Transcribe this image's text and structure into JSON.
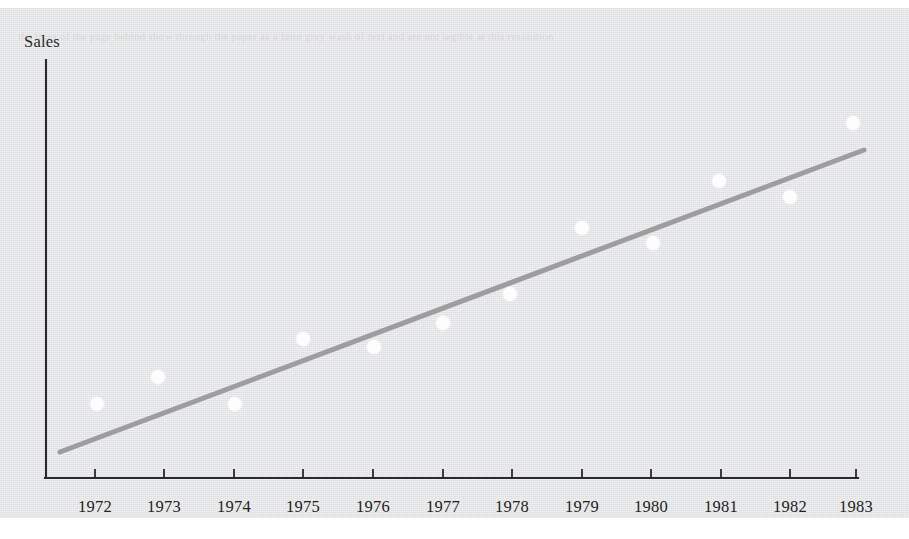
{
  "figure": {
    "y_axis_label": "Sales",
    "background_note": "scanned-book-page"
  },
  "ghost_text": "the lines of the page behind show through the paper as a faint grey wash of text and are not legible at this resolution",
  "chart_data": {
    "type": "scatter",
    "title": "",
    "xlabel": "",
    "ylabel": "Sales",
    "grid": false,
    "legend": "none",
    "axes": {
      "x_axis_visible": true,
      "y_axis_visible": true,
      "x_tick_labels": [
        "1972",
        "1973",
        "1974",
        "1975",
        "1976",
        "1977",
        "1978",
        "1979",
        "1980",
        "1981",
        "1982",
        "1983"
      ],
      "y_tick_labels": [],
      "xlim": [
        1971.3,
        1983.0
      ],
      "ylim": [
        0,
        100
      ]
    },
    "categories": [
      "1972",
      "1973",
      "1974",
      "1975",
      "1976",
      "1977",
      "1978",
      "1979",
      "1980",
      "1981",
      "1982",
      "1983"
    ],
    "x": [
      1972,
      1973,
      1974,
      1975,
      1976,
      1977,
      1978,
      1979,
      1980,
      1981,
      1982,
      1983
    ],
    "values": [
      18.1,
      24.6,
      19.0,
      32.6,
      31.1,
      37.1,
      44.1,
      60.0,
      56.6,
      71.8,
      67.7,
      85.4
    ],
    "series": [
      {
        "name": "Sales observations",
        "type": "scatter",
        "marker": "circle",
        "marker_color": "#fdfdfd",
        "marker_radius_px": 7,
        "values": [
          18.1,
          24.6,
          19.0,
          32.6,
          31.1,
          37.1,
          44.1,
          60.0,
          56.6,
          71.8,
          67.7,
          85.4
        ]
      },
      {
        "name": "Fitted trend line",
        "type": "line",
        "line_color": "#9a9a9a",
        "line_width_px": 5,
        "x_endpoints": [
          1971.5,
          1983.1
        ],
        "y_endpoints": [
          6.2,
          78.2
        ]
      }
    ],
    "points_px": [
      {
        "label": "1972",
        "cx": 97,
        "cy": 404
      },
      {
        "label": "1973",
        "cx": 158,
        "cy": 377
      },
      {
        "label": "1974",
        "cx": 235,
        "cy": 404
      },
      {
        "label": "1975",
        "cx": 303,
        "cy": 339
      },
      {
        "label": "1976",
        "cx": 374,
        "cy": 347
      },
      {
        "label": "1977",
        "cx": 443,
        "cy": 323
      },
      {
        "label": "1978",
        "cx": 510,
        "cy": 294
      },
      {
        "label": "1979",
        "cx": 582,
        "cy": 228
      },
      {
        "label": "1980",
        "cx": 653,
        "cy": 243
      },
      {
        "label": "1981",
        "cx": 719,
        "cy": 181
      },
      {
        "label": "1982",
        "cx": 790,
        "cy": 197
      },
      {
        "label": "1983",
        "cx": 853,
        "cy": 123
      }
    ],
    "trend_line_px": {
      "x1": 60,
      "y1": 452,
      "x2": 864,
      "y2": 150
    },
    "axis_px": {
      "origin_x": 46,
      "origin_y": 478,
      "y_top": 60,
      "x_right": 858,
      "tick_x": [
        95,
        164,
        234,
        303,
        373,
        443,
        512,
        582,
        651,
        721,
        790,
        856
      ],
      "tick_length": 9
    },
    "colors": {
      "axis": "#2a2a2a",
      "marker": "#fdfdfd",
      "trend": "#9a9a9a",
      "paper": "#e3e4e5",
      "text": "#232323"
    }
  }
}
